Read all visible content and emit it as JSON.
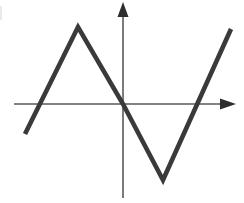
{
  "figure": {
    "background_color": "#ffffff",
    "width": 244,
    "height": 203
  },
  "axes": {
    "x_axis": {
      "name": "horizontal-axis",
      "color": "#5a5a5a",
      "stroke_width": 1.6,
      "y": 104,
      "x_start": 14,
      "x_end": 236,
      "arrow": {
        "direction": "right",
        "tip_x": 236,
        "tip_y": 104,
        "base_x": 220,
        "half_height": 5.5,
        "color": "#2e2e2e"
      }
    },
    "y_axis": {
      "name": "vertical-axis",
      "color": "#5a5a5a",
      "stroke_width": 1.6,
      "x": 123,
      "y_start": 198,
      "y_end": 14,
      "arrow": {
        "direction": "up",
        "tip_x": 123,
        "tip_y": 2,
        "base_y": 17,
        "half_width": 5.5,
        "color": "#2e2e2e"
      }
    },
    "origin": {
      "x": 123,
      "y": 104
    }
  },
  "chart_data": {
    "type": "line",
    "title": "",
    "xlabel": "",
    "ylabel": "",
    "grid": false,
    "legend": false,
    "points_pixels": [
      {
        "label": "start-lower-left",
        "x": 25,
        "y": 134
      },
      {
        "label": "peak-maximum",
        "x": 78,
        "y": 27
      },
      {
        "label": "origin-crossing",
        "x": 123,
        "y": 104
      },
      {
        "label": "valley-minimum",
        "x": 163,
        "y": 180
      },
      {
        "label": "end-upper-right",
        "x": 231,
        "y": 29
      }
    ],
    "x": [
      -4.2,
      -2.2,
      0,
      1.5,
      4.1
    ],
    "y": [
      -1.2,
      3.0,
      0,
      -2.2,
      2.9
    ],
    "xlim": [
      -4.4,
      4.4
    ],
    "ylim": [
      -2.6,
      3.2
    ],
    "zero_crossings_pixels": [
      {
        "label": "left-x-intercept",
        "x": 40,
        "y": 104
      },
      {
        "label": "origin-x-intercept",
        "x": 123,
        "y": 104
      },
      {
        "label": "right-x-intercept",
        "x": 197,
        "y": 104
      }
    ],
    "segments": [
      {
        "name": "rising-segment-1",
        "from": "start-lower-left",
        "to": "peak-maximum",
        "slope_sign": "positive"
      },
      {
        "name": "falling-segment",
        "from": "peak-maximum",
        "to": "valley-minimum",
        "slope_sign": "negative"
      },
      {
        "name": "rising-segment-2",
        "from": "valley-minimum",
        "to": "end-upper-right",
        "slope_sign": "positive"
      }
    ],
    "style": {
      "stroke_color": "#3a3a3a",
      "stroke_width": 4.6
    }
  },
  "artifacts": {
    "left_edge_smudge": {
      "name": "scan-smudge",
      "x": 0,
      "y": 6,
      "width": 2,
      "height": 14,
      "color": "#e9e9e9"
    }
  }
}
